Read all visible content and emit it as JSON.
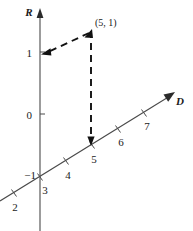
{
  "figure": {
    "title": "",
    "axes": {
      "vertical": {
        "name": "R",
        "label": "R",
        "arrow": "up-arrow-icon",
        "tick_labels": [
          "1",
          "0",
          "−1"
        ]
      },
      "slanted": {
        "name": "D",
        "label": "D",
        "arrow": "up-right-arrow-icon",
        "tick_labels": [
          "2",
          "3",
          "4",
          "5",
          "6",
          "7"
        ]
      }
    },
    "point": {
      "label": "(5, 1)",
      "d_value": "5",
      "r_value": "1"
    },
    "projections": {
      "to_r_axis_arrow": "left-arrow-icon",
      "to_d_axis_arrow": "down-arrow-icon",
      "style": "dashed"
    },
    "colors": {
      "axis": "#3a3a3a",
      "dashed": "#111111",
      "text": "#1a1a1a",
      "background": "#ffffff"
    }
  }
}
